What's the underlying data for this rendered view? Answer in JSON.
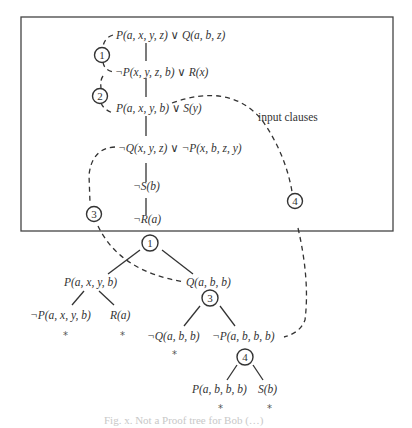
{
  "figure": {
    "box_label": "input clauses",
    "input_clauses": [
      {
        "text": "P(a, x, y, z) ∨ Q(a, b, z)"
      },
      {
        "text": "¬P(x, y, z, b) ∨ R(x)"
      },
      {
        "text": "P(a, x, y, b) ∨ S(y)"
      },
      {
        "text": "¬Q(x, y, z) ∨ ¬P(x, b, z, y)"
      },
      {
        "text": "¬S(b)"
      },
      {
        "text": "¬R(a)"
      }
    ],
    "step_markers": [
      "1",
      "2",
      "3",
      "4"
    ],
    "tree": {
      "root_marker": "1",
      "level1": [
        {
          "text": "P(a, x, y, b)"
        },
        {
          "text": "Q(a, b, b)"
        }
      ],
      "level2_left": [
        {
          "text": "¬P(a, x, y, b)",
          "closed": "*"
        },
        {
          "text": "R(a)",
          "closed": "*"
        }
      ],
      "marker_3": "3",
      "level2_right": [
        {
          "text": "¬Q(a, b, b)",
          "closed": "*"
        },
        {
          "text": "¬P(a, b, b, b)"
        }
      ],
      "marker_4": "4",
      "level3": [
        {
          "text": "P(a, b, b, b)",
          "closed": "*"
        },
        {
          "text": "S(b)",
          "closed": "*"
        }
      ]
    },
    "caption": "Fig. x. Not a Proof tree for Bob (…)",
    "colors": {
      "line": "#333333",
      "box_border": "#444444",
      "background": "#ffffff"
    }
  }
}
